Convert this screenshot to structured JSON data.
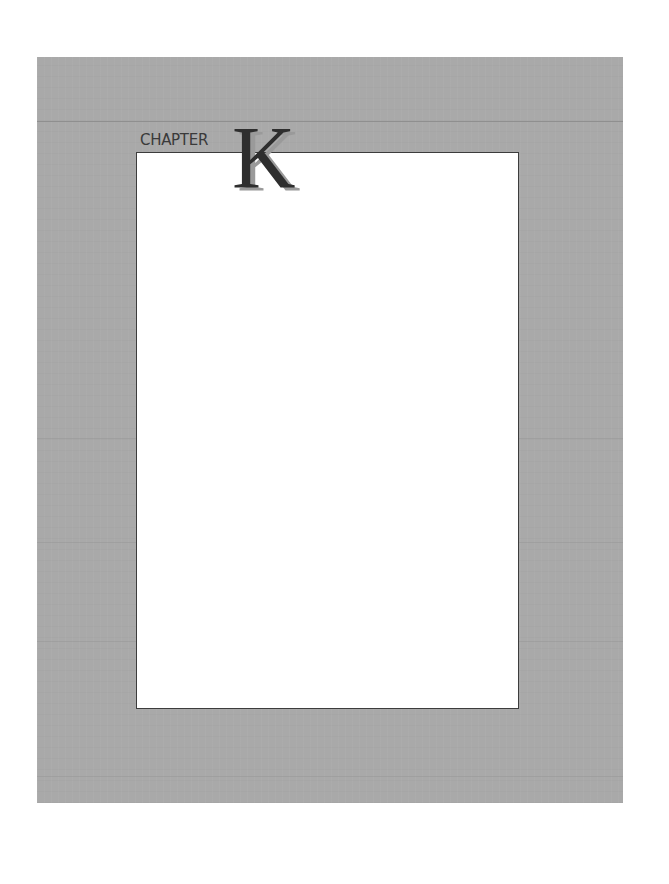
{
  "page": {
    "chapter_label": "CHAPTER",
    "chapter_letter": "K",
    "colors": {
      "panel_gray": "#a9a9a9",
      "box_white": "#ffffff",
      "box_border": "#3c3c3c",
      "letter_dark": "#2e2e2e",
      "letter_shadow": "#9a9a9a"
    }
  }
}
